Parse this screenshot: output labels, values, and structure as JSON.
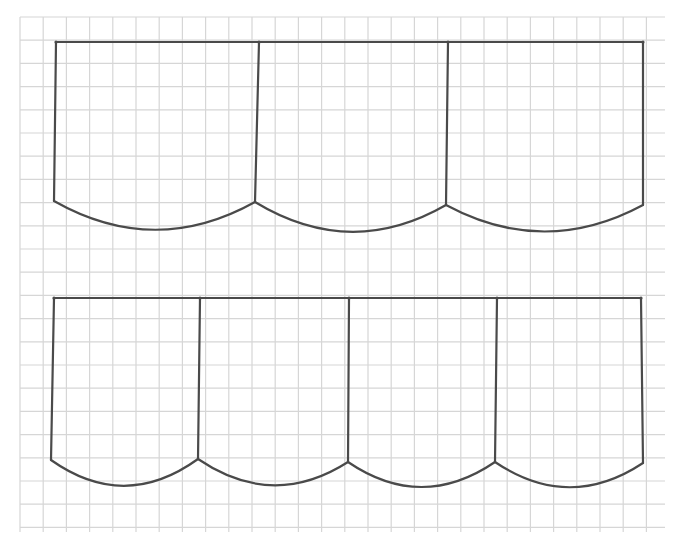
{
  "canvas": {
    "width": 682,
    "height": 544,
    "background": "#ffffff"
  },
  "grid": {
    "x0": 20,
    "y0": 17,
    "x1": 665,
    "y1": 532,
    "spacing": 23.2,
    "color": "#d6d6d6"
  },
  "ink": {
    "color": "#4a4a4a",
    "width": 2.2
  },
  "drawings": [
    {
      "name": "three-panel-valance",
      "top_y": 42,
      "posts": [
        {
          "x_top": 56,
          "x_bot": 54,
          "y_bot": 201
        },
        {
          "x_top": 259,
          "x_bot": 255,
          "y_bot": 202
        },
        {
          "x_top": 448,
          "x_bot": 446,
          "y_bot": 205
        },
        {
          "x_top": 643,
          "x_bot": 643,
          "y_bot": 205
        }
      ],
      "scallops": [
        {
          "ctrl_y": 258
        },
        {
          "ctrl_y": 260
        },
        {
          "ctrl_y": 258
        }
      ]
    },
    {
      "name": "four-panel-valance",
      "top_y": 298,
      "posts": [
        {
          "x_top": 54,
          "x_bot": 51,
          "y_bot": 460
        },
        {
          "x_top": 200,
          "x_bot": 198,
          "y_bot": 459
        },
        {
          "x_top": 349,
          "x_bot": 348,
          "y_bot": 462
        },
        {
          "x_top": 497,
          "x_bot": 495,
          "y_bot": 462
        },
        {
          "x_top": 641,
          "x_bot": 643,
          "y_bot": 463
        }
      ],
      "scallops": [
        {
          "ctrl_y": 512
        },
        {
          "ctrl_y": 510
        },
        {
          "ctrl_y": 512
        },
        {
          "ctrl_y": 512
        }
      ]
    }
  ]
}
